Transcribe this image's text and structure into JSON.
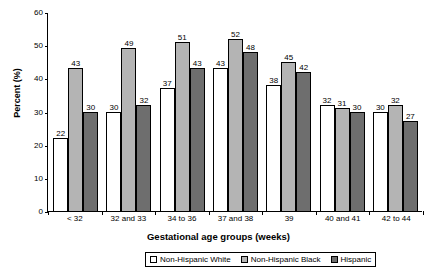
{
  "chart_data": {
    "type": "bar",
    "title": "",
    "xlabel": "Gestational age groups (weeks)",
    "ylabel": "Percent (%)",
    "ylim": [
      0,
      60
    ],
    "yticks": [
      0,
      10,
      20,
      30,
      40,
      50,
      60
    ],
    "grid": false,
    "legend_position": "bottom",
    "categories": [
      "< 32",
      "32 and 33",
      "34 to 36",
      "37 and 38",
      "39",
      "40 and 41",
      "42 to 44"
    ],
    "series": [
      {
        "name": "Non-Hispanic White",
        "color": "#ffffff",
        "values": [
          22,
          30,
          37,
          43,
          38,
          32,
          30
        ]
      },
      {
        "name": "Non-Hispanic Black",
        "color": "#b4b4b4",
        "values": [
          43,
          49,
          51,
          52,
          45,
          31,
          32
        ]
      },
      {
        "name": "Hispanic",
        "color": "#6e6e6e",
        "values": [
          30,
          32,
          43,
          48,
          42,
          30,
          27
        ]
      }
    ]
  }
}
